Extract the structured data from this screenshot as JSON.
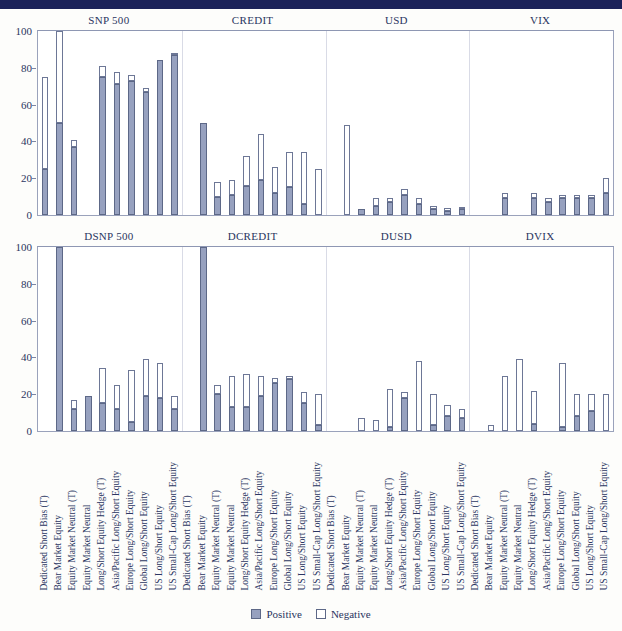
{
  "legend": {
    "positive": "Positive",
    "negative": "Negative"
  },
  "axis": {
    "ticks": [
      0,
      20,
      40,
      60,
      80,
      100
    ],
    "ymin": 0,
    "ymax": 100
  },
  "strategies": [
    "Dedicated Short Bias (T)",
    "Bear Market Equity",
    "Equity Market Neutral (T)",
    "Equity Market Neutral",
    "Long/Short Equity Hedge (T)",
    "Asia/Pacific Long/Short Equity",
    "Europe Long/Short Equity",
    "Global Long/Short Equity",
    "US Long/Short Equity",
    "US Small-Cap Long/Short Equity"
  ],
  "chart_data": [
    {
      "type": "bar",
      "title": "",
      "subtitle": "Level factors",
      "xlabel": "",
      "ylabel": "",
      "ylim": [
        0,
        100
      ],
      "grid": false,
      "stacked": true,
      "legend_position": "bottom",
      "groups": [
        "SNP 500",
        "CREDIT",
        "USD",
        "VIX"
      ],
      "categories": [
        "Dedicated Short Bias (T)",
        "Bear Market Equity",
        "Equity Market Neutral (T)",
        "Equity Market Neutral",
        "Long/Short Equity Hedge (T)",
        "Asia/Pacific Long/Short Equity",
        "Europe Long/Short Equity",
        "Global Long/Short Equity",
        "US Long/Short Equity",
        "US Small-Cap Long/Short Equity"
      ],
      "series": [
        {
          "name": "Positive",
          "values": [
            25,
            50,
            37,
            0,
            75,
            71,
            73,
            67,
            84,
            87,
            0,
            50,
            10,
            11,
            16,
            19,
            12,
            15,
            6,
            0,
            0,
            0,
            3,
            5,
            7,
            11,
            6,
            3,
            2,
            3,
            0,
            0,
            9,
            0,
            9,
            7,
            9,
            9,
            9,
            12
          ]
        },
        {
          "name": "Negative",
          "values": [
            50,
            50,
            4,
            0,
            6,
            7,
            3,
            2,
            0,
            1,
            0,
            0,
            8,
            8,
            16,
            25,
            14,
            19,
            28,
            25,
            0,
            49,
            0,
            4,
            2,
            3,
            3,
            2,
            2,
            1,
            0,
            0,
            3,
            0,
            3,
            2,
            2,
            2,
            2,
            8
          ]
        }
      ]
    },
    {
      "type": "bar",
      "title": "",
      "subtitle": "Difference factors",
      "xlabel": "",
      "ylabel": "",
      "ylim": [
        0,
        100
      ],
      "grid": false,
      "stacked": true,
      "legend_position": "bottom",
      "groups": [
        "DSNP 500",
        "DCREDIT",
        "DUSD",
        "DVIX"
      ],
      "categories": [
        "Dedicated Short Bias (T)",
        "Bear Market Equity",
        "Equity Market Neutral (T)",
        "Equity Market Neutral",
        "Long/Short Equity Hedge (T)",
        "Asia/Pacific Long/Short Equity",
        "Europe Long/Short Equity",
        "Global Long/Short Equity",
        "US Long/Short Equity",
        "US Small-Cap Long/Short Equity"
      ],
      "series": [
        {
          "name": "Positive",
          "values": [
            0,
            100,
            12,
            19,
            15,
            12,
            5,
            19,
            18,
            12,
            0,
            100,
            20,
            13,
            13,
            19,
            26,
            28,
            15,
            3,
            0,
            0,
            0,
            0,
            2,
            18,
            0,
            3,
            8,
            7,
            0,
            0,
            0,
            0,
            4,
            0,
            2,
            8,
            11,
            0
          ]
        },
        {
          "name": "Negative",
          "values": [
            0,
            0,
            5,
            0,
            19,
            13,
            28,
            20,
            19,
            7,
            0,
            0,
            5,
            17,
            18,
            11,
            3,
            2,
            6,
            17,
            0,
            0,
            7,
            6,
            21,
            3,
            38,
            17,
            6,
            5,
            0,
            3,
            30,
            39,
            18,
            0,
            35,
            12,
            9,
            20
          ]
        }
      ]
    }
  ]
}
